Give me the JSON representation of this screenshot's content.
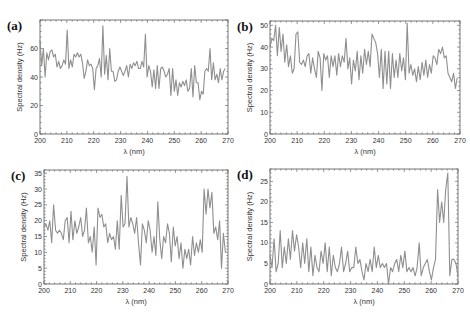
{
  "chart_data": [
    {
      "panel": "(a)",
      "type": "line",
      "title": "",
      "xlabel": "λ (nm)",
      "ylabel": "Spectral density (Hz)",
      "xlim": [
        200,
        270
      ],
      "ylim": [
        0,
        80
      ],
      "xticks": [
        200,
        210,
        220,
        230,
        240,
        250,
        260,
        270
      ],
      "yticks": [
        0,
        20,
        40,
        60
      ],
      "grid": false,
      "frame": {
        "x": 40,
        "y": 20,
        "w": 188,
        "h": 114
      },
      "values": [
        66,
        48,
        60,
        40,
        57,
        52,
        58,
        59,
        54,
        56,
        47,
        51,
        46,
        48,
        52,
        49,
        73,
        46,
        52,
        47,
        56,
        54,
        57,
        54,
        56,
        50,
        39,
        44,
        52,
        48,
        49,
        46,
        31,
        46,
        48,
        53,
        40,
        76,
        42,
        55,
        38,
        60,
        44,
        44,
        37,
        38,
        44,
        47,
        44,
        41,
        44,
        48,
        40,
        49,
        46,
        50,
        48,
        51,
        46,
        46,
        51,
        47,
        70,
        40,
        48,
        44,
        33,
        45,
        32,
        48,
        32,
        46,
        47,
        44,
        40,
        42,
        46,
        27,
        46,
        30,
        38,
        27,
        36,
        33,
        37,
        34,
        38,
        30,
        32,
        46,
        26,
        48,
        36,
        36,
        24,
        30,
        28,
        44,
        46,
        44,
        60,
        38,
        50,
        38,
        42,
        36,
        46,
        38,
        44,
        46
      ],
      "x_start": 200,
      "x_end": 269
    },
    {
      "panel": "(b)",
      "type": "line",
      "title": "",
      "xlabel": "λ (nm)",
      "ylabel": "Spectral density (Hz)",
      "xlim": [
        200,
        270
      ],
      "ylim": [
        0,
        52
      ],
      "xticks": [
        200,
        210,
        220,
        230,
        240,
        250,
        260,
        270
      ],
      "yticks": [
        0,
        10,
        20,
        30,
        40,
        50
      ],
      "grid": false,
      "frame": {
        "x": 270,
        "y": 21,
        "w": 190,
        "h": 113
      },
      "values": [
        40,
        44,
        43,
        50,
        36,
        49,
        38,
        46,
        33,
        41,
        31,
        36,
        28,
        30,
        46,
        47,
        33,
        32,
        34,
        31,
        36,
        37,
        28,
        35,
        30,
        26,
        38,
        35,
        20,
        37,
        34,
        36,
        26,
        36,
        31,
        36,
        27,
        37,
        31,
        36,
        33,
        44,
        30,
        35,
        23,
        34,
        29,
        38,
        25,
        36,
        28,
        39,
        32,
        38,
        31,
        46,
        44,
        42,
        37,
        26,
        39,
        21,
        38,
        23,
        38,
        21,
        37,
        26,
        34,
        26,
        37,
        29,
        35,
        25,
        51,
        28,
        32,
        27,
        30,
        24,
        31,
        25,
        33,
        27,
        34,
        26,
        32,
        28,
        36,
        35,
        32,
        39,
        37,
        40,
        35,
        36,
        28,
        26,
        24,
        28,
        21,
        26
      ],
      "x_start": 200,
      "x_end": 269
    },
    {
      "panel": "(c)",
      "type": "line",
      "title": "",
      "xlabel": "λ (nm)",
      "ylabel": "Spectral density (Hz)",
      "xlim": [
        200,
        270
      ],
      "ylim": [
        0,
        36
      ],
      "xticks": [
        200,
        210,
        220,
        230,
        240,
        250,
        260,
        270
      ],
      "yticks": [
        0,
        5,
        10,
        15,
        20,
        25,
        30,
        35
      ],
      "grid": false,
      "frame": {
        "x": 44,
        "y": 170,
        "w": 184,
        "h": 114
      },
      "values": [
        18,
        19,
        17,
        20,
        13,
        25,
        17,
        16,
        17,
        16,
        14,
        20,
        21,
        13,
        23,
        14,
        20,
        16,
        18,
        21,
        15,
        17,
        24,
        13,
        15,
        10,
        18,
        6,
        24,
        21,
        22,
        18,
        19,
        13,
        16,
        14,
        15,
        11,
        20,
        11,
        28,
        18,
        19,
        34,
        18,
        21,
        19,
        16,
        21,
        13,
        6,
        19,
        17,
        13,
        20,
        17,
        10,
        15,
        9,
        26,
        14,
        8,
        15,
        13,
        19,
        16,
        7,
        18,
        12,
        15,
        8,
        13,
        5,
        11,
        8,
        11,
        6,
        15,
        9,
        13,
        10,
        14,
        10,
        30,
        22,
        30,
        24,
        29,
        16,
        18,
        14,
        20,
        5,
        16,
        10
      ],
      "x_start": 200,
      "x_end": 269
    },
    {
      "panel": "(d)",
      "type": "line",
      "title": "",
      "xlabel": "λ (nm)",
      "ylabel": "Spectral density (Hz)",
      "xlim": [
        200,
        270
      ],
      "ylim": [
        0,
        28
      ],
      "xticks": [
        200,
        210,
        220,
        230,
        240,
        250,
        260,
        270
      ],
      "yticks": [
        0,
        5,
        10,
        15,
        20,
        25
      ],
      "grid": false,
      "frame": {
        "x": 270,
        "y": 169,
        "w": 188,
        "h": 115
      },
      "values": [
        7,
        4,
        11,
        3,
        5,
        13,
        4,
        9,
        5,
        11,
        6,
        13,
        8,
        12,
        9,
        4,
        10,
        5,
        11,
        3,
        9,
        2,
        7,
        4,
        3,
        8,
        5,
        10,
        3,
        9,
        2,
        7,
        4,
        3,
        5,
        9,
        3,
        5,
        8,
        3,
        4,
        4,
        9,
        5,
        6,
        3,
        1,
        5,
        3,
        6,
        3,
        9,
        4,
        7,
        4,
        5,
        4,
        5,
        0,
        4,
        3,
        5,
        6,
        3,
        7,
        4,
        8,
        3,
        4,
        3,
        4,
        2,
        4,
        10,
        2,
        4,
        5,
        6,
        3,
        1,
        4,
        6,
        23,
        15,
        20,
        15,
        23,
        27,
        2,
        6,
        6,
        5,
        2
      ],
      "x_start": 200,
      "x_end": 270
    }
  ],
  "panels": [
    {
      "label": "(a)",
      "xlabel": "λ (nm)",
      "ylabel": "Spectral density (Hz)"
    },
    {
      "label": "(b)",
      "xlabel": "λ (nm)",
      "ylabel": "Spectral density (Hz)"
    },
    {
      "label": "(c)",
      "xlabel": "λ (nm)",
      "ylabel": "Spectral density (Hz)"
    },
    {
      "label": "(d)",
      "xlabel": "λ (nm)",
      "ylabel": "Spectral density (Hz)"
    }
  ],
  "style": {
    "line_color": "#8f8f8f",
    "frame_color": "#555555",
    "background": "#ffffff"
  }
}
